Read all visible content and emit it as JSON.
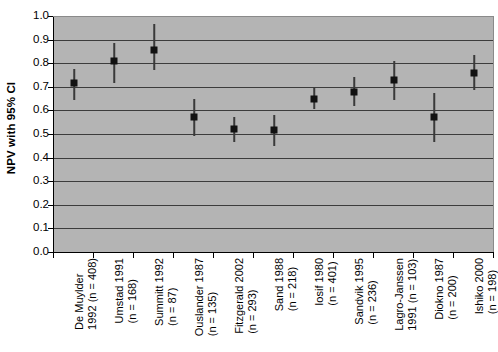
{
  "chart_data": {
    "type": "scatter",
    "title": "",
    "xlabel": "",
    "ylabel": "NPV with 95% CI",
    "ylim": [
      0.0,
      1.0
    ],
    "ytick_labels": [
      "1.0",
      "0.9",
      "0.8",
      "0.7",
      "0.6",
      "0.5",
      "0.4",
      "0.3",
      "0.2",
      "0.1",
      "0.0"
    ],
    "ytick_values": [
      1.0,
      0.9,
      0.8,
      0.7,
      0.6,
      0.5,
      0.4,
      0.3,
      0.2,
      0.1,
      0.0
    ],
    "grid": true,
    "legend": "none",
    "error_bar_type": "95% CI",
    "categories": [
      "De Muylder 1992 (n = 408)",
      "Umstad 1991 (n = 168)",
      "Summitt 1992 (n = 87)",
      "Ouslander 1987 (n = 135)",
      "Fitzgerald 2002 (n = 293)",
      "Sand 1988 (n = 218)",
      "Iosif 1980 (n = 401)",
      "Sandvik 1995 (n = 236)",
      "Lagro-Janssen 1991 (n = 103)",
      "Diokno 1987 (n = 200)",
      "Ishiko 2000 (n = 198)"
    ],
    "category_lines": [
      [
        "De Muylder",
        "1992 (n = 408)"
      ],
      [
        "Umstad 1991",
        "(n = 168)"
      ],
      [
        "Summitt 1992",
        "(n = 87)"
      ],
      [
        "Ouslander 1987",
        "(n = 135)"
      ],
      [
        "Fitzgerald 2002",
        "(n = 293)"
      ],
      [
        "Sand 1988",
        "(n = 218)"
      ],
      [
        "Iosif 1980",
        "(n = 401)"
      ],
      [
        "Sandvik 1995",
        "(n = 236)"
      ],
      [
        "Lagro-Janssen",
        "1991 (n = 103)"
      ],
      [
        "Diokno 1987",
        "(n = 200)"
      ],
      [
        "Ishiko 2000",
        "(n = 198)"
      ]
    ],
    "study_names": [
      "De Muylder",
      "Umstad",
      "Summitt",
      "Ouslander",
      "Fitzgerald",
      "Sand",
      "Iosif",
      "Sandvik",
      "Lagro-Janssen",
      "Diokno",
      "Ishiko"
    ],
    "years": [
      1992,
      1991,
      1992,
      1987,
      2002,
      1988,
      1980,
      1995,
      1991,
      1987,
      2000
    ],
    "n": [
      408,
      168,
      87,
      135,
      293,
      218,
      401,
      236,
      103,
      200,
      198
    ],
    "values": [
      0.715,
      0.81,
      0.855,
      0.57,
      0.52,
      0.515,
      0.65,
      0.68,
      0.73,
      0.57,
      0.76
    ],
    "ci_lower": [
      0.645,
      0.715,
      0.77,
      0.49,
      0.465,
      0.45,
      0.605,
      0.62,
      0.645,
      0.465,
      0.685
    ],
    "ci_upper": [
      0.775,
      0.885,
      0.965,
      0.65,
      0.57,
      0.58,
      0.7,
      0.74,
      0.81,
      0.675,
      0.835
    ],
    "colors": {
      "plot_background": "#b4b4b4",
      "gridline": "#3c3c3c",
      "marker": "#111111",
      "error_bar": "#3a3a3a",
      "axis": "#000000",
      "page_background": "#ffffff"
    }
  }
}
